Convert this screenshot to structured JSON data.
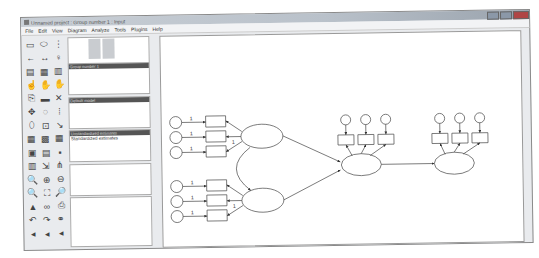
{
  "window": {
    "title": "Unnamed project : Group number 1 : Input"
  },
  "menu": [
    "File",
    "Edit",
    "View",
    "Diagram",
    "Analyze",
    "Tools",
    "Plugins",
    "Help"
  ],
  "toolbox": [
    "rectangle",
    "ellipse",
    "indicator",
    "path",
    "covariance",
    "unique-variable",
    "title",
    "list-variables-model",
    "list-variables-data",
    "select-one",
    "select-all",
    "deselect-all",
    "duplicate",
    "move",
    "erase",
    "shape-change",
    "rotate",
    "reflect",
    "move-parameters",
    "scroll",
    "touch-up",
    "data-files",
    "analysis-properties",
    "calculate-estimates",
    "copy",
    "text-output",
    "save",
    "object-properties",
    "drag-properties",
    "preserve-symmetries",
    "zoom-select",
    "zoom-in",
    "zoom-out",
    "page-view",
    "fit-to-page",
    "magnifier",
    "bayesian",
    "multiple-group",
    "print",
    "undo",
    "redo",
    "specification-search",
    "left",
    "left2",
    "left3"
  ],
  "panels": {
    "groups": {
      "header": "Group number 1"
    },
    "models": {
      "header": "Default model"
    },
    "estimates": {
      "items": [
        "Unstandardized estimates",
        "Standardized estimates"
      ]
    }
  },
  "diagram": {
    "path_label": "1"
  }
}
